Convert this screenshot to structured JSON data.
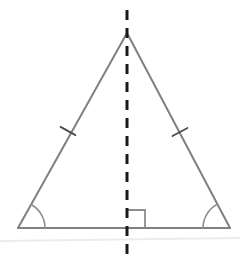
{
  "canvas": {
    "width": 240,
    "height": 271,
    "background_color": "#ffffff"
  },
  "figure": {
    "name": "isosceles-triangle-with-altitude",
    "title": "",
    "caption": "",
    "stroke_color": "#808080",
    "stroke_width": 2,
    "dash_color": "#1a1a1a",
    "dash_width": 3,
    "dash_pattern": "10 8",
    "faint_line_color": "#ececec",
    "faint_line_width": 2
  },
  "geometry": {
    "apex": {
      "label": "",
      "x": 127,
      "y": 33
    },
    "base_left": {
      "label": "",
      "x": 18,
      "y": 228
    },
    "base_right": {
      "label": "",
      "x": 230,
      "y": 228
    },
    "altitude_foot": {
      "label": "",
      "x": 127,
      "y": 228
    },
    "altitude_top_y": 10,
    "altitude_bottom_y": 262,
    "base_y": 228,
    "left_leg": {
      "from": "apex",
      "to": "base_left"
    },
    "right_leg": {
      "from": "apex",
      "to": "base_right"
    },
    "base_edge": {
      "from": "base_left",
      "to": "base_right"
    }
  },
  "annotations": {
    "congruence_ticks": [
      {
        "name": "left-leg-tick",
        "cx": 68,
        "cy": 131,
        "length": 17,
        "count": 1
      },
      {
        "name": "right-leg-tick",
        "cx": 180,
        "cy": 132,
        "length": 17,
        "count": 1
      }
    ],
    "angle_arcs": [
      {
        "name": "left-base-angle-arc",
        "vertex": "base_left",
        "radius": 27
      },
      {
        "name": "right-base-angle-arc",
        "vertex": "base_right",
        "radius": 27
      }
    ],
    "right_angle_marker": {
      "name": "right-angle-square",
      "vertex": "altitude_foot",
      "size": 18,
      "opens": "right"
    },
    "ground_line": {
      "name": "faint-ground-line",
      "x1": 0,
      "y1": 241,
      "x2": 240,
      "y2": 238
    }
  },
  "labels": {
    "vertices": [],
    "sides": [],
    "angles": []
  }
}
